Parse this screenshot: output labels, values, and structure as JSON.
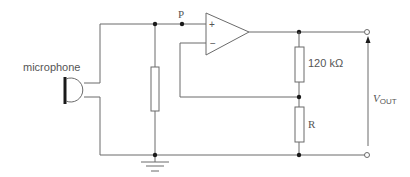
{
  "diagram": {
    "type": "circuit",
    "labels": {
      "microphone": "microphone",
      "node_p": "P",
      "plus": "+",
      "minus": "−",
      "r_feedback": "120 kΩ",
      "r_ground": "R",
      "vout_main": "V",
      "vout_sub": "OUT"
    },
    "components": [
      {
        "id": "mic",
        "kind": "microphone",
        "label": "microphone"
      },
      {
        "id": "r_input",
        "kind": "resistor",
        "label": ""
      },
      {
        "id": "opamp",
        "kind": "op-amp",
        "inputs": [
          "+",
          "−"
        ]
      },
      {
        "id": "r_feedback",
        "kind": "resistor",
        "label": "120 kΩ"
      },
      {
        "id": "r_ground",
        "kind": "resistor",
        "label": "R"
      },
      {
        "id": "ground",
        "kind": "ground"
      },
      {
        "id": "vout",
        "kind": "output-terminals",
        "label": "VOUT"
      }
    ],
    "colors": {
      "wire": "#6b6b6b",
      "node": "#1a1a1a",
      "text": "#555555",
      "background": "#ffffff"
    }
  }
}
